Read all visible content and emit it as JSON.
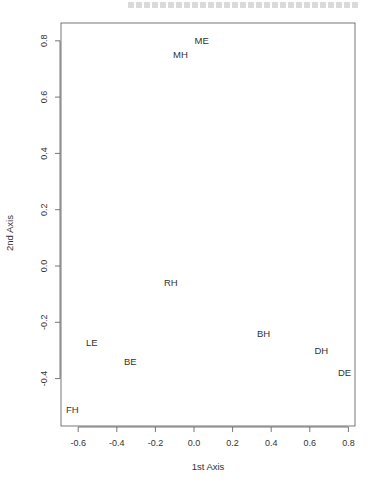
{
  "chart_data": {
    "type": "scatter",
    "title": "",
    "xlabel": "1st Axis",
    "ylabel": "2nd Axis",
    "xlim": [
      -0.68,
      0.84
    ],
    "ylim": [
      -0.56,
      0.86
    ],
    "xticks": [
      -0.6,
      -0.4,
      -0.2,
      0.0,
      0.2,
      0.4,
      0.6,
      0.8
    ],
    "xtick_labels": [
      "-0.6",
      "-0.4",
      "-0.2",
      "0.0",
      "0.2",
      "0.4",
      "0.6",
      "0.8"
    ],
    "yticks": [
      -0.4,
      -0.2,
      0.0,
      0.2,
      0.4,
      0.6,
      0.8
    ],
    "ytick_labels": [
      "-0.4",
      "-0.2",
      "0.0",
      "0.2",
      "0.4",
      "0.6",
      "0.8"
    ],
    "grid": false,
    "legend": null,
    "points": [
      {
        "label": "ME",
        "x": 0.04,
        "y": 0.8
      },
      {
        "label": "MH",
        "x": -0.07,
        "y": 0.75
      },
      {
        "label": "RH",
        "x": -0.12,
        "y": -0.06
      },
      {
        "label": "BH",
        "x": 0.36,
        "y": -0.24
      },
      {
        "label": "DH",
        "x": 0.66,
        "y": -0.3
      },
      {
        "label": "DE",
        "x": 0.78,
        "y": -0.38
      },
      {
        "label": "LE",
        "x": -0.53,
        "y": -0.27
      },
      {
        "label": "BE",
        "x": -0.33,
        "y": -0.34
      },
      {
        "label": "FH",
        "x": -0.63,
        "y": -0.51
      }
    ]
  }
}
